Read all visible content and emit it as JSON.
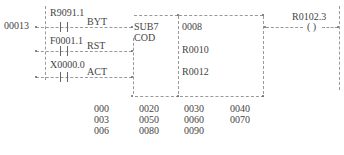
{
  "rung": {
    "number": "00013",
    "contacts": [
      {
        "address": "R9091.1",
        "input_label": "BYT"
      },
      {
        "address": "F0001.1",
        "input_label": "RST"
      },
      {
        "address": "X0000.0",
        "input_label": "ACT"
      }
    ],
    "function_block": {
      "name": "SUB7",
      "sub_label": "COD",
      "params": [
        "0008",
        "R0010",
        "R0012"
      ]
    },
    "coil": {
      "address": "R0102.3",
      "symbol": "( )"
    }
  },
  "table": {
    "rows": [
      [
        "000",
        "0020",
        "0030",
        "0040"
      ],
      [
        "003",
        "0050",
        "0060",
        "0070"
      ],
      [
        "006",
        "0080",
        "0090",
        ""
      ]
    ]
  }
}
